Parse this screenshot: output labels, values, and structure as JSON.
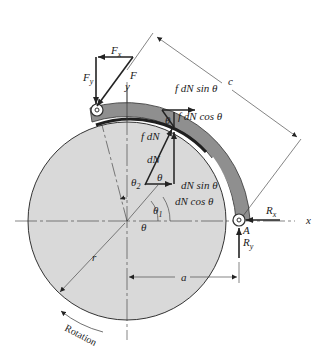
{
  "figure": {
    "type": "free-body diagram of pivoted long-shoe internal drum brake",
    "colors": {
      "drum": "#d9d9d9",
      "shoe": "#8f8f8f",
      "lining": "#2a2a2a",
      "line": "#222222"
    }
  },
  "labels": {
    "Fx": "F",
    "Fx_sub": "x",
    "Fy": "F",
    "Fy_sub": "y",
    "F": "F",
    "y_axis": "y",
    "x_axis": "x",
    "f_dN_sin": "f dN sin θ",
    "f_dN_cos": "f dN cos θ",
    "f_dN": "f dN",
    "dN": "dN",
    "dN_sin": "dN sin θ",
    "dN_cos": "dN cos θ",
    "theta": "θ",
    "theta_top": "θ",
    "theta_mid": "θ",
    "theta1": "θ",
    "theta1_sub": "1",
    "theta2": "θ",
    "theta2_sub": "2",
    "c": "c",
    "a": "a",
    "r": "r",
    "Rx": "R",
    "Rx_sub": "x",
    "Ry": "R",
    "Ry_sub": "y",
    "A": "A",
    "rotation": "Rotation"
  }
}
